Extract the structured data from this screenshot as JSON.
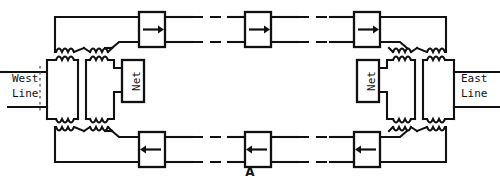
{
  "figure": {
    "caption": "A"
  },
  "terminals": {
    "west": {
      "line1": "West",
      "line2": "Line",
      "name": "west-line-terminal"
    },
    "east": {
      "line1": "East",
      "line2": "Line",
      "name": "east-line-terminal"
    }
  },
  "networks": [
    {
      "label": "Net",
      "side": "west"
    },
    {
      "label": "Net",
      "side": "east"
    }
  ],
  "paths": {
    "top": {
      "name": "westbound-to-eastbound-go-path",
      "direction": "right",
      "arrow_glyph": "→",
      "repeaters": [
        {
          "index": 1,
          "arrow": "→"
        },
        {
          "index": 2,
          "arrow": "→"
        },
        {
          "index": 3,
          "arrow": "→"
        }
      ]
    },
    "bottom": {
      "name": "eastbound-to-westbound-return-path",
      "direction": "left",
      "arrow_glyph": "←",
      "repeaters": [
        {
          "index": 1,
          "arrow": "←"
        },
        {
          "index": 2,
          "arrow": "←"
        },
        {
          "index": 3,
          "arrow": "←"
        }
      ]
    }
  },
  "hybrids": {
    "west": {
      "coil_count": 8,
      "name": "west-hybrid-transformer-set"
    },
    "east": {
      "coil_count": 8,
      "name": "east-hybrid-transformer-set"
    }
  },
  "colors": {
    "line": "#111111",
    "background": "#ffffff",
    "separator": "#555555"
  }
}
